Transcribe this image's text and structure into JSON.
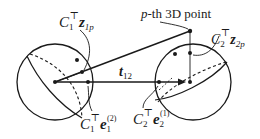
{
  "diagram": {
    "type": "two-sphere camera geometry",
    "stroke_color": "#1a1a1a",
    "background": "#ffffff",
    "labels": {
      "point_label_var": "p",
      "point_label_text": "-th 3D point",
      "z1": {
        "base": "C",
        "base_sub": "1",
        "sup": "⊤",
        "vec": "z",
        "vec_sub": "1p"
      },
      "z2": {
        "base": "C",
        "base_sub": "2",
        "sup": "⊤",
        "vec": "z",
        "vec_sub": "2p"
      },
      "e1": {
        "base": "C",
        "base_sub": "1",
        "sup": "⊤",
        "vec": "e",
        "vec_sub": "1",
        "vec_sup": "(2)"
      },
      "e2": {
        "base": "C",
        "base_sub": "2",
        "sup": "⊤",
        "vec": "e",
        "vec_sub": "2",
        "vec_sup": "(1)"
      },
      "baseline": {
        "vec": "t",
        "sub": "12"
      }
    },
    "spheres": [
      {
        "name": "sphere-camera-1",
        "cx": 55,
        "cy": 82,
        "r": 38
      },
      {
        "name": "sphere-camera-2",
        "cx": 193,
        "cy": 82,
        "r": 38
      }
    ],
    "point_3d": {
      "x": 190,
      "y": 31
    }
  }
}
